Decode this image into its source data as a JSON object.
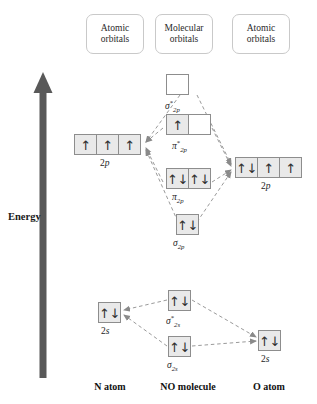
{
  "diagram": {
    "energy_axis_label": "Energy",
    "colors": {
      "filled_orbital": "#e9e9e9",
      "empty_orbital": "#ffffff",
      "orbital_border": "#8d8d8d",
      "connector": "#9a9a9a",
      "axis_arrow": "#595959",
      "header_border": "#c9c9c9"
    }
  },
  "headers": [
    {
      "line1": "Atomic",
      "line2": "orbitals"
    },
    {
      "line1": "Molecular",
      "line2": "orbitals"
    },
    {
      "line1": "Atomic",
      "line2": "orbitals"
    }
  ],
  "footers": [
    {
      "label": "N atom"
    },
    {
      "label": "NO molecule"
    },
    {
      "label": "O atom"
    }
  ],
  "atomic_left": {
    "p_level": {
      "label_base": "2",
      "label_italic": "p",
      "cells": [
        "↑",
        "↑",
        "↑"
      ]
    },
    "s_level": {
      "label_base": "2",
      "label_italic": "s",
      "cells": [
        "↑↓"
      ]
    }
  },
  "atomic_right": {
    "p_level": {
      "label_base": "2",
      "label_italic": "p",
      "cells": [
        "↑↓",
        "↑",
        "↑"
      ]
    },
    "s_level": {
      "label_base": "2",
      "label_italic": "s",
      "cells": [
        "↑↓"
      ]
    }
  },
  "molecular": {
    "sigma_star_2p": {
      "symbol": "σ",
      "star": "*",
      "sub": "2p",
      "cells": [
        ""
      ]
    },
    "pi_star_2p": {
      "symbol": "π",
      "star": "*",
      "sub": "2p",
      "cells": [
        "↑",
        ""
      ]
    },
    "pi_2p": {
      "symbol": "π",
      "star": "",
      "sub": "2p",
      "cells": [
        "↑↓",
        "↑↓"
      ]
    },
    "sigma_2p": {
      "symbol": "σ",
      "star": "",
      "sub": "2p",
      "cells": [
        "↑↓"
      ]
    },
    "sigma_star_2s": {
      "symbol": "σ",
      "star": "*",
      "sub": "2s",
      "cells": [
        "↑↓"
      ]
    },
    "sigma_2s": {
      "symbol": "σ",
      "star": "",
      "sub": "2s",
      "cells": [
        "↑↓"
      ]
    }
  }
}
